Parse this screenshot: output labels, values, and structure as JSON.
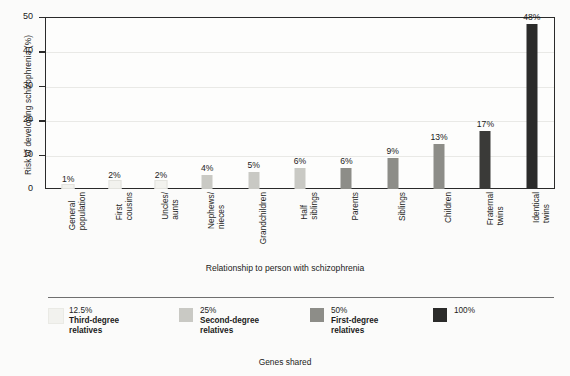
{
  "chart_data": {
    "type": "bar",
    "title": "",
    "xlabel": "Relationship to person with schizophrenia",
    "ylabel": "Risk of developing schizophrenia (%)",
    "ylim": [
      0,
      50
    ],
    "yticks": [
      0,
      10,
      20,
      30,
      40,
      50
    ],
    "grid": true,
    "legend_position": "bottom",
    "categories": [
      "General population",
      "First cousins",
      "Uncles/ aunts",
      "Nephews/ nieces",
      "Grandchildren",
      "Half siblings",
      "Parents",
      "Siblings",
      "Children",
      "Fraternal twins",
      "Identical twins"
    ],
    "category_lines": [
      [
        "General",
        "population"
      ],
      [
        "First",
        "cousins"
      ],
      [
        "Uncles/",
        "aunts"
      ],
      [
        "Nephews/",
        "nieces"
      ],
      [
        "Grandchildren"
      ],
      [
        "Half",
        "siblings"
      ],
      [
        "Parents"
      ],
      [
        "Siblings"
      ],
      [
        "Children"
      ],
      [
        "Fraternal",
        "twins"
      ],
      [
        "Identical",
        "twins"
      ]
    ],
    "values": [
      1,
      2,
      2,
      4,
      5,
      6,
      6,
      9,
      13,
      17,
      48
    ],
    "value_labels": [
      "1%",
      "2%",
      "2%",
      "4%",
      "5%",
      "6%",
      "6%",
      "9%",
      "13%",
      "17%",
      "48%"
    ],
    "bar_colors": [
      "#f2f2ee",
      "#f2f2ee",
      "#f2f2ee",
      "#c9c9c4",
      "#c9c9c4",
      "#c9c9c4",
      "#8d8d88",
      "#8d8d88",
      "#8d8d88",
      "#3a3a38",
      "#2b2b2a"
    ],
    "group_of_bar": [
      0,
      0,
      0,
      1,
      1,
      1,
      2,
      2,
      2,
      3,
      3
    ],
    "legend_title": "Genes shared",
    "legend": [
      {
        "percent": "12.5%",
        "line2": "Third-degree",
        "line3": "relatives",
        "color": "#f2f2ee"
      },
      {
        "percent": "25%",
        "line2": "Second-degree",
        "line3": "relatives",
        "color": "#c9c9c4"
      },
      {
        "percent": "50%",
        "line2": "First-degree",
        "line3": "relatives",
        "color": "#8d8d88"
      },
      {
        "percent": "100%",
        "line2": "",
        "line3": "",
        "color": "#2b2b2a"
      }
    ]
  }
}
